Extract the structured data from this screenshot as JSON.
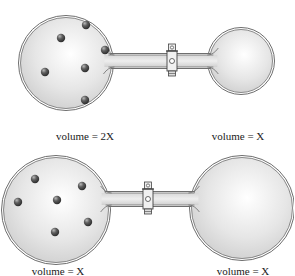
{
  "diagrams": [
    {
      "id": "top",
      "left_label": "volume = 2X",
      "right_label": "volume = X",
      "left_bulb": {
        "cx": 66,
        "cy": 63,
        "r": 46
      },
      "right_bulb": {
        "cx": 241,
        "cy": 61,
        "r": 32
      },
      "tube": {
        "x1": 108,
        "x2": 214,
        "cy": 61,
        "h": 12
      },
      "valve": {
        "x": 172,
        "cy": 61
      },
      "particles": [
        [
          86,
          25
        ],
        [
          61,
          38
        ],
        [
          105,
          50
        ],
        [
          45,
          72
        ],
        [
          85,
          68
        ],
        [
          85,
          100
        ]
      ],
      "left_label_pos": [
        85,
        130
      ],
      "right_label_pos": [
        238,
        130
      ]
    },
    {
      "id": "bottom",
      "left_label": "volume = X",
      "right_label": "volume = X",
      "left_bulb": {
        "cx": 56,
        "cy": 210,
        "r": 53
      },
      "right_bulb": {
        "cx": 242,
        "cy": 208,
        "r": 51
      },
      "tube": {
        "x1": 100,
        "x2": 196,
        "cy": 199,
        "h": 12
      },
      "valve": {
        "x": 148,
        "cy": 199
      },
      "particles": [
        [
          35,
          179
        ],
        [
          82,
          186
        ],
        [
          57,
          200
        ],
        [
          18,
          202
        ],
        [
          88,
          222
        ],
        [
          55,
          232
        ]
      ],
      "left_label_pos": [
        58,
        265
      ],
      "right_label_pos": [
        243,
        265
      ]
    }
  ],
  "colors": {
    "glass_outline": "#6e6e6e",
    "glass_fill_center": "#ffffff",
    "glass_fill_edge": "#d4d4d4",
    "particle": "#5a5a5a",
    "valve": "#e8e8e8"
  }
}
